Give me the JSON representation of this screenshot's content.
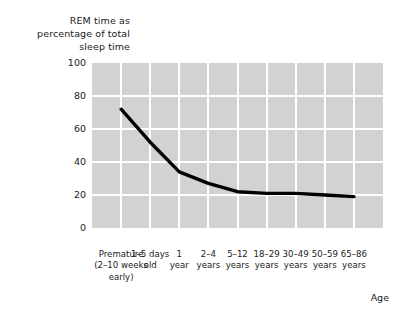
{
  "chart_data": {
    "type": "line",
    "title": "REM time as percentage of total sleep time",
    "ylabel": "REM time as\npercentage of total\nsleep time",
    "xlabel": "Age",
    "ylim": [
      0,
      100
    ],
    "yticks": [
      "0",
      "20",
      "40",
      "60",
      "80",
      "100"
    ],
    "ytick_values": [
      0,
      20,
      40,
      60,
      80,
      100
    ],
    "grid": true,
    "legend": "none",
    "categories": [
      "Premature\n(2–10 weeks\nearly)",
      "1–5 days\nold",
      "1\nyear",
      "2–4\nyears",
      "5–12\nyears",
      "18–29\nyears",
      "30–49\nyears",
      "50–59\nyears",
      "65–86\nyears"
    ],
    "values": [
      72,
      52,
      34,
      27,
      22,
      21,
      21,
      20,
      19
    ],
    "series": [
      {
        "name": "REM percentage of total sleep time",
        "values": [
          72,
          52,
          34,
          27,
          22,
          21,
          21,
          20,
          19
        ]
      }
    ],
    "line_color": "#000000",
    "plot_background": "#d2d2d2",
    "grid_color": "#ffffff"
  }
}
